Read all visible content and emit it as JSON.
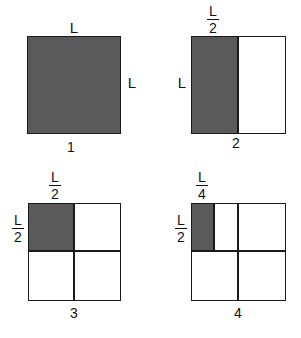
{
  "panels": [
    {
      "number": "1",
      "top_label": "L",
      "side_label": "L",
      "shaded_fraction": "1"
    },
    {
      "number": "2",
      "top_label": {
        "numerator": "L",
        "denominator": "2"
      },
      "side_label": "L",
      "shaded_fraction": "1/2"
    },
    {
      "number": "3",
      "top_label": {
        "numerator": "L",
        "denominator": "2"
      },
      "side_label": {
        "numerator": "L",
        "denominator": "2"
      },
      "shaded_fraction": "1/4"
    },
    {
      "number": "4",
      "top_label": {
        "numerator": "L",
        "denominator": "4"
      },
      "side_label": {
        "numerator": "L",
        "denominator": "2"
      },
      "shaded_fraction": "1/8"
    }
  ],
  "colors": {
    "shade": "#5a5a5a",
    "outline": "#1a1a1a",
    "background": "#ffffff"
  }
}
